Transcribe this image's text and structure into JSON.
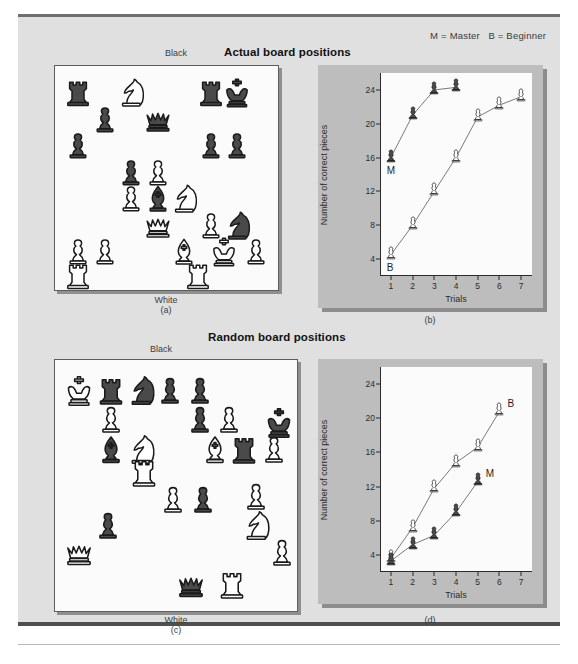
{
  "figure": {
    "legend": "M = Master   B = Beginner",
    "panels": {
      "a": {
        "title": "Actual board positions",
        "top_label": "Black",
        "bottom_label": "White",
        "caption": "(a)"
      },
      "b": {
        "caption": "(b)"
      },
      "c": {
        "title": "Random board positions",
        "top_label": "Black",
        "bottom_label": "White",
        "caption": "(c)"
      },
      "d": {
        "caption": "(d)"
      }
    },
    "colors": {
      "page_background": "#e0e0e0",
      "plot_background": "#fbfbfb",
      "chart_frame": "#bdbdbd",
      "black_piece": "#4a4a4a",
      "white_piece": "#ffffff",
      "outline": "#1a1a1a",
      "axis": "#2b2b2b",
      "rule_top": "#6e6e6e",
      "rule_bottom": "#4f4f4f"
    }
  },
  "boards": {
    "actual": {
      "name": "Actual board positions",
      "pieces": [
        {
          "type": "rook",
          "color": "black",
          "col": 0.5,
          "row": 0.5
        },
        {
          "type": "knight",
          "color": "white",
          "col": 2.5,
          "row": 0.5
        },
        {
          "type": "rook",
          "color": "black",
          "col": 5.5,
          "row": 0.5
        },
        {
          "type": "king",
          "color": "black",
          "col": 6.5,
          "row": 0.5
        },
        {
          "type": "pawn",
          "color": "black",
          "col": 1.5,
          "row": 1.5
        },
        {
          "type": "queen",
          "color": "black",
          "col": 3.5,
          "row": 1.5
        },
        {
          "type": "pawn",
          "color": "black",
          "col": 0.5,
          "row": 2.5
        },
        {
          "type": "pawn",
          "color": "black",
          "col": 5.5,
          "row": 2.5
        },
        {
          "type": "pawn",
          "color": "black",
          "col": 6.5,
          "row": 2.5
        },
        {
          "type": "pawn",
          "color": "black",
          "col": 2.5,
          "row": 3.5
        },
        {
          "type": "pawn",
          "color": "white",
          "col": 3.5,
          "row": 3.5
        },
        {
          "type": "pawn",
          "color": "white",
          "col": 2.5,
          "row": 4.5
        },
        {
          "type": "bishop",
          "color": "black",
          "col": 3.5,
          "row": 4.5
        },
        {
          "type": "knight",
          "color": "white",
          "col": 4.5,
          "row": 4.5
        },
        {
          "type": "queen",
          "color": "white",
          "col": 3.5,
          "row": 5.5
        },
        {
          "type": "pawn",
          "color": "white",
          "col": 5.5,
          "row": 5.5
        },
        {
          "type": "knight",
          "color": "black",
          "col": 6.5,
          "row": 5.5
        },
        {
          "type": "pawn",
          "color": "white",
          "col": 0.5,
          "row": 6.5
        },
        {
          "type": "pawn",
          "color": "white",
          "col": 1.5,
          "row": 6.5
        },
        {
          "type": "bishop",
          "color": "white",
          "col": 4.5,
          "row": 6.5
        },
        {
          "type": "king",
          "color": "white",
          "col": 6.0,
          "row": 6.5
        },
        {
          "type": "pawn",
          "color": "white",
          "col": 7.2,
          "row": 6.5
        },
        {
          "type": "rook",
          "color": "white",
          "col": 0.5,
          "row": 7.4
        },
        {
          "type": "rook",
          "color": "white",
          "col": 5.0,
          "row": 7.4
        }
      ]
    },
    "random": {
      "name": "Random board positions",
      "pieces": [
        {
          "type": "king",
          "color": "white",
          "col": 0.4,
          "row": 0.5
        },
        {
          "type": "rook",
          "color": "black",
          "col": 1.5,
          "row": 0.5
        },
        {
          "type": "knight",
          "color": "black",
          "col": 2.5,
          "row": 0.5
        },
        {
          "type": "pawn",
          "color": "black",
          "col": 3.5,
          "row": 0.5
        },
        {
          "type": "pawn",
          "color": "black",
          "col": 4.5,
          "row": 0.5
        },
        {
          "type": "pawn",
          "color": "white",
          "col": 1.5,
          "row": 1.5
        },
        {
          "type": "pawn",
          "color": "black",
          "col": 4.5,
          "row": 1.5
        },
        {
          "type": "pawn",
          "color": "white",
          "col": 5.5,
          "row": 1.5
        },
        {
          "type": "king",
          "color": "black",
          "col": 7.2,
          "row": 1.6
        },
        {
          "type": "bishop",
          "color": "black",
          "col": 1.5,
          "row": 2.5
        },
        {
          "type": "knight",
          "color": "white",
          "col": 2.5,
          "row": 2.5
        },
        {
          "type": "bishop",
          "color": "white",
          "col": 5.0,
          "row": 2.5
        },
        {
          "type": "rook",
          "color": "black",
          "col": 6.0,
          "row": 2.5
        },
        {
          "type": "pawn",
          "color": "white",
          "col": 7.0,
          "row": 2.5
        },
        {
          "type": "rook",
          "color": "white",
          "col": 2.6,
          "row": 3.3
        },
        {
          "type": "pawn",
          "color": "white",
          "col": 3.6,
          "row": 4.2
        },
        {
          "type": "pawn",
          "color": "black",
          "col": 4.6,
          "row": 4.2
        },
        {
          "type": "pawn",
          "color": "white",
          "col": 6.4,
          "row": 4.1
        },
        {
          "type": "pawn",
          "color": "black",
          "col": 1.4,
          "row": 5.1
        },
        {
          "type": "knight",
          "color": "white",
          "col": 6.4,
          "row": 5.1
        },
        {
          "type": "queen",
          "color": "white",
          "col": 0.4,
          "row": 6.0
        },
        {
          "type": "pawn",
          "color": "white",
          "col": 7.3,
          "row": 6.0
        },
        {
          "type": "queen",
          "color": "black",
          "col": 4.2,
          "row": 7.1
        },
        {
          "type": "rook",
          "color": "white",
          "col": 5.6,
          "row": 7.1
        }
      ]
    }
  },
  "chart_data": [
    {
      "id": "b",
      "type": "line",
      "title": "Actual board positions",
      "caption": "(b)",
      "xlabel": "Trials",
      "ylabel": "Number of correct pieces",
      "x": [
        1,
        2,
        3,
        4,
        5,
        6,
        7
      ],
      "xticklabels": [
        "1",
        "2",
        "3",
        "4",
        "5",
        "6",
        "7"
      ],
      "yticks": [
        4,
        8,
        12,
        16,
        20,
        24
      ],
      "ylim": [
        2,
        26
      ],
      "xlim": [
        0.5,
        7.5
      ],
      "grid": false,
      "marker": "chess-pawn",
      "series": [
        {
          "name": "M",
          "label": "M",
          "legend": "Master",
          "marker_color": "black",
          "x": [
            1,
            2,
            3,
            4
          ],
          "values": [
            16,
            21,
            24,
            24.3
          ]
        },
        {
          "name": "B",
          "label": "B",
          "legend": "Beginner",
          "marker_color": "white",
          "x": [
            1,
            2,
            3,
            4,
            5,
            6,
            7
          ],
          "values": [
            4.5,
            8,
            12,
            16,
            20.8,
            22.2,
            23.2
          ]
        }
      ]
    },
    {
      "id": "d",
      "type": "line",
      "title": "Random board positions",
      "caption": "(d)",
      "xlabel": "Trials",
      "ylabel": "Number of correct pieces",
      "x": [
        1,
        2,
        3,
        4,
        5,
        6,
        7
      ],
      "xticklabels": [
        "1",
        "2",
        "3",
        "4",
        "5",
        "6",
        "7"
      ],
      "yticks": [
        4,
        8,
        12,
        16,
        20,
        24
      ],
      "ylim": [
        2,
        26
      ],
      "xlim": [
        0.5,
        7.5
      ],
      "grid": false,
      "marker": "chess-pawn",
      "series": [
        {
          "name": "B",
          "label": "B",
          "legend": "Beginner",
          "marker_color": "white",
          "x": [
            1,
            2,
            3,
            4,
            5,
            6
          ],
          "values": [
            3.6,
            7.2,
            11.8,
            14.8,
            16.6,
            20.8
          ]
        },
        {
          "name": "M",
          "label": "M",
          "legend": "Master",
          "marker_color": "black",
          "x": [
            1,
            2,
            3,
            4,
            5
          ],
          "values": [
            3.3,
            5.2,
            6.3,
            9.0,
            12.6
          ]
        }
      ]
    }
  ]
}
